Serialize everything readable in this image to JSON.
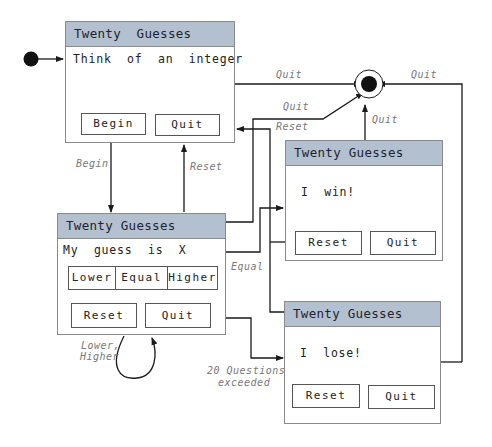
{
  "diagram": {
    "type": "state-diagram"
  },
  "windows": {
    "start": {
      "title": "Twenty  Guesses",
      "message": "Think  of  an  integer",
      "buttons": [
        "Begin",
        "Quit"
      ]
    },
    "guess": {
      "title": "Twenty Guesses",
      "message": "My  guess  is  X",
      "choice_buttons": [
        "Lower",
        "Equal",
        "Higher"
      ],
      "buttons": [
        "Reset",
        "Quit"
      ]
    },
    "win": {
      "title": "Twenty Guesses",
      "message": "I  win!",
      "buttons": [
        "Reset",
        "Quit"
      ]
    },
    "lose": {
      "title": "Twenty Guesses",
      "message": "I  lose!",
      "buttons": [
        "Reset",
        "Quit"
      ]
    }
  },
  "transitions": {
    "begin": "Begin",
    "reset_to_start": "Reset",
    "quit_from_start": "Quit",
    "quit_from_guess": "Quit",
    "reset_from_win": "Reset",
    "quit_from_win": "Quit",
    "quit_from_lose": "Quit",
    "equal": "Equal",
    "self_loop_line1": "Lower,",
    "self_loop_line2": "Higher",
    "exceeded_line1": "20 Questions",
    "exceeded_line2": "exceeded"
  },
  "colors": {
    "header": "#b3c0cf",
    "border": "#8a8a8a",
    "line": "#1a1a1a",
    "label": "#777777"
  }
}
